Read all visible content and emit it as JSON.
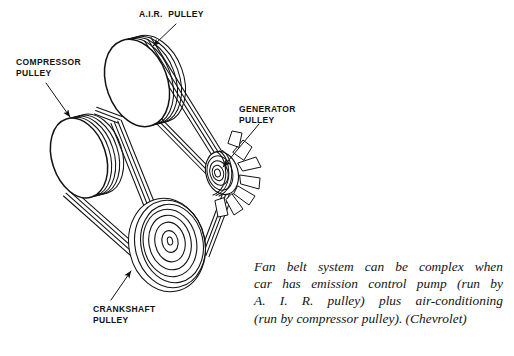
{
  "figure": {
    "kind": "line-diagram",
    "background_color": "#ffffff",
    "ink_color": "#121212"
  },
  "labels": [
    {
      "id": "air",
      "name": "air-pulley-label",
      "line1": "A.I.R.  PULLEY",
      "line2": ""
    },
    {
      "id": "compressor",
      "name": "compressor-pulley-label",
      "line1": "COMPRESSOR",
      "line2": "PULLEY"
    },
    {
      "id": "generator",
      "name": "generator-pulley-label",
      "line1": "GENERATOR",
      "line2": "PULLEY"
    },
    {
      "id": "crankshaft",
      "name": "crankshaft-pulley-label",
      "line1": "CRANKSHAFT",
      "line2": "PULLEY"
    }
  ],
  "caption": {
    "line1": "Fan belt system can be complex when",
    "line2": "car has emission control pump (run by",
    "line3": "A. I. R. pulley) plus air-conditioning",
    "line4": "(run by compressor pulley). (Chevrolet)",
    "attribution": "(Chevrolet)"
  },
  "components": {
    "air_pulley": "A.I.R. pulley",
    "compressor_pulley": "compressor pulley",
    "generator_pulley": "generator pulley",
    "crankshaft_pulley": "crankshaft pulley",
    "fan": "engine cooling fan"
  }
}
